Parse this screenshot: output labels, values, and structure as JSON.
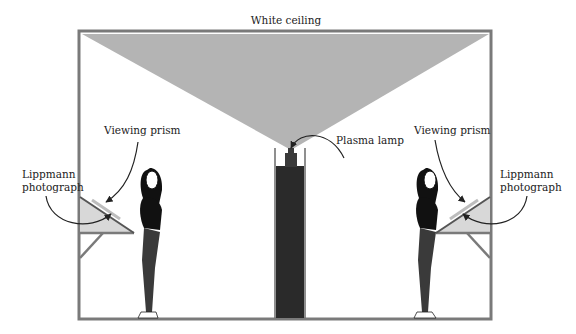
{
  "diagram": {
    "title_label": "White ceiling",
    "labels": {
      "plasma_lamp": "Plasma lamp",
      "left_viewing_prism": "Viewing prism",
      "left_lippmann_line1": "Lippmann",
      "left_lippmann_line2": "photograph",
      "right_viewing_prism": "Viewing prism",
      "right_lippmann_line1": "Lippmann",
      "right_lippmann_line2": "photograph"
    },
    "colors": {
      "frame": "#7a7a7a",
      "light_cone": "#b4b4b4",
      "lamp_column": "#2a2a2a",
      "prism_fill": "#d8d8d8",
      "figure_top": "#111111",
      "figure_legs": "#3a3a3a"
    }
  }
}
